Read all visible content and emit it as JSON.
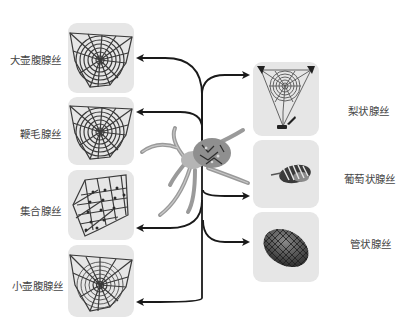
{
  "diagram": {
    "title": "",
    "center": {
      "name": "spider",
      "icon": "spider-icon"
    },
    "left_glands": [
      {
        "label": "大壶腹腺丝",
        "web": "orb-web-dense"
      },
      {
        "label": "鞭毛腺丝",
        "web": "orb-web-dense"
      },
      {
        "label": "集合腺丝",
        "web": "web-sector-with-glue-droplets"
      },
      {
        "label": "小壶腹腺丝",
        "web": "orb-web-sparse"
      }
    ],
    "right_glands": [
      {
        "label": "梨状腺丝",
        "web": "anchored-orb-web"
      },
      {
        "label": "葡萄状腺丝",
        "web": "wrapped-prey"
      },
      {
        "label": "管状腺丝",
        "web": "egg-sac"
      }
    ],
    "colors": {
      "panel_bg": "#e6e6e6",
      "line": "#1a1a1a",
      "web": "#3a3a3a",
      "label": "#444444"
    }
  }
}
